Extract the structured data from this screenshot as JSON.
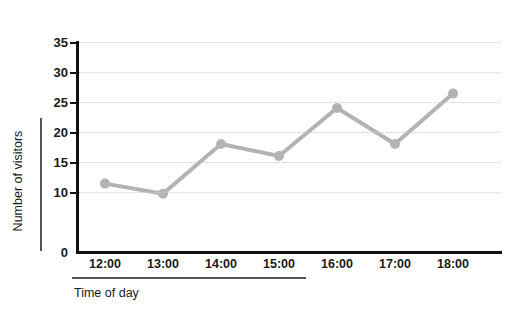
{
  "chart_data": {
    "type": "line",
    "title": "",
    "xlabel": "Time of day",
    "ylabel": "Number of visitors",
    "categories": [
      "12:00",
      "13:00",
      "14:00",
      "15:00",
      "16:00",
      "17:00",
      "18:00"
    ],
    "values": [
      11.4,
      9.7,
      18,
      16,
      24,
      18,
      26.4
    ],
    "series": [
      {
        "name": "Number of visitors",
        "values": [
          11.4,
          9.7,
          18,
          16,
          24,
          18,
          26.4
        ]
      }
    ],
    "ylim": [
      0,
      35
    ],
    "yticks": [
      0,
      10,
      15,
      20,
      25,
      30,
      35
    ],
    "ytick_labels": [
      "0",
      "10",
      "15",
      "20",
      "25",
      "30",
      "35"
    ],
    "xtick_labels": [
      "12:00",
      "13:00",
      "14:00",
      "15:00",
      "16:00",
      "17:00",
      "18:00"
    ],
    "grid": true,
    "grid_axis": "y",
    "grid_style": "dotted",
    "legend": false,
    "legend_position": "none",
    "colors": {
      "series_line": "#b3b3b3",
      "marker": "#b3b3b3",
      "axis": "#111111",
      "gridline": "#c9c9c9",
      "text": "#1a1a1a",
      "title_rule": "#555555",
      "background": "#ffffff"
    },
    "line_width": 4,
    "marker_radius": 5
  },
  "axes": {
    "y_title": "Number of visitors",
    "x_title": "Time of day"
  }
}
